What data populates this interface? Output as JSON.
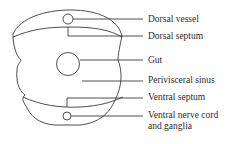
{
  "diagram": {
    "type": "cross-section",
    "stroke_color": "#3a3a3a",
    "text_color": "#2b2b2b",
    "labels": [
      {
        "id": "dorsal-vessel",
        "text": "Dorsal vessel",
        "x": 148,
        "y": 14
      },
      {
        "id": "dorsal-septum",
        "text": "Dorsal septum",
        "x": 148,
        "y": 31
      },
      {
        "id": "gut",
        "text": "Gut",
        "x": 148,
        "y": 55
      },
      {
        "id": "perivisceral-sinus",
        "text": "Perivisceral sinus",
        "x": 148,
        "y": 75
      },
      {
        "id": "ventral-septum",
        "text": "Ventral septum",
        "x": 148,
        "y": 92
      },
      {
        "id": "ventral-nerve-cord",
        "text": "Ventral nerve cord",
        "x": 148,
        "y": 109
      },
      {
        "id": "ventral-nerve-cord-2",
        "text": "and ganglia",
        "x": 148,
        "y": 120
      }
    ]
  }
}
